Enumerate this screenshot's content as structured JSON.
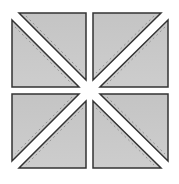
{
  "diagram": {
    "colors": {
      "fill": "#c8c8c8",
      "outline": "#333333",
      "seam": "#888888",
      "gap": "#ffffff"
    },
    "quadrants": [
      {
        "id": "top-left",
        "diagonal": "backslash"
      },
      {
        "id": "top-right",
        "diagonal": "slash"
      },
      {
        "id": "bottom-left",
        "diagonal": "slash"
      },
      {
        "id": "bottom-right",
        "diagonal": "backslash"
      }
    ]
  }
}
